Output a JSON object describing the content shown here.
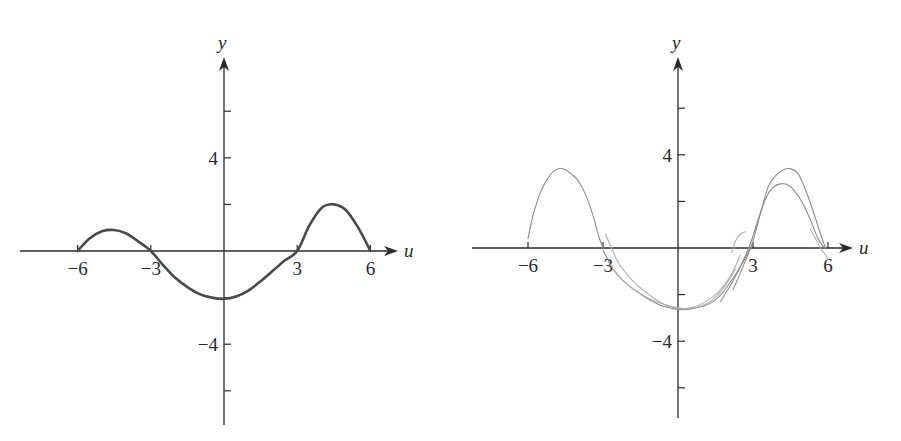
{
  "chart_data": [
    {
      "type": "line",
      "title": "",
      "xlabel": "u",
      "ylabel": "y",
      "xlim": [
        -8.5,
        7.5
      ],
      "ylim": [
        -7.5,
        8
      ],
      "x_ticks": [
        -6,
        -3,
        3,
        6
      ],
      "x_tick_labels": [
        "−6",
        "−3",
        "3",
        "6"
      ],
      "y_ticks": [
        -6,
        -4,
        -2,
        2,
        4,
        6
      ],
      "y_tick_labels": {
        "4": "4",
        "-4": "−4"
      },
      "grid": false,
      "series": [
        {
          "name": "graph",
          "style": "main",
          "x": [
            -6,
            -5.5,
            -5,
            -4.5,
            -4,
            -3.5,
            -3,
            -2.5,
            -2,
            -1.5,
            -1,
            -0.5,
            0,
            0.5,
            1,
            1.5,
            2,
            2.5,
            3,
            3.5,
            4,
            4.5,
            5,
            5.5,
            6
          ],
          "y": [
            0,
            0.55,
            0.85,
            0.9,
            0.75,
            0.4,
            0,
            -0.6,
            -1.15,
            -1.55,
            -1.85,
            -2.0,
            -2.05,
            -1.95,
            -1.7,
            -1.3,
            -0.85,
            -0.4,
            0,
            1.1,
            1.85,
            2.0,
            1.75,
            1.0,
            0
          ]
        }
      ]
    },
    {
      "type": "line",
      "title": "",
      "xlabel": "u",
      "ylabel": "y",
      "xlim": [
        -8.5,
        7.5
      ],
      "ylim": [
        -7.5,
        8
      ],
      "x_ticks": [
        -6,
        -3,
        3,
        6
      ],
      "x_tick_labels": [
        "−6",
        "−3",
        "3",
        "6"
      ],
      "y_ticks": [
        -6,
        -4,
        -2,
        2,
        4,
        6
      ],
      "y_tick_labels": {
        "4": "4",
        "-4": "−4"
      },
      "grid": false,
      "series": [
        {
          "name": "sketch-left-hump",
          "style": "sketch",
          "x": [
            -6,
            -5.8,
            -5.5,
            -5.2,
            -4.9,
            -4.6,
            -4.3,
            -4.0,
            -3.7,
            -3.4,
            -3.2,
            -3.0
          ],
          "y": [
            0.4,
            1.4,
            2.4,
            3.0,
            3.35,
            3.4,
            3.2,
            2.9,
            2.3,
            1.4,
            0.6,
            0
          ]
        },
        {
          "name": "sketch-middle-1",
          "style": "sketch",
          "x": [
            -3,
            -2.6,
            -2.2,
            -1.8,
            -1.4,
            -1.0,
            -0.6,
            -0.2,
            0.2,
            0.6,
            1.0,
            1.4,
            1.8,
            2.2,
            2.6,
            2.9
          ],
          "y": [
            -0.1,
            -0.9,
            -1.4,
            -1.75,
            -2.05,
            -2.3,
            -2.5,
            -2.6,
            -2.65,
            -2.6,
            -2.5,
            -2.3,
            -1.9,
            -1.3,
            -0.6,
            0
          ]
        },
        {
          "name": "sketch-middle-2",
          "style": "sketch-light",
          "x": [
            -2.9,
            -2.4,
            -1.9,
            -1.4,
            -0.9,
            -0.4,
            0.1,
            0.6,
            1.1,
            1.6,
            2.1,
            2.5
          ],
          "y": [
            0.6,
            -0.6,
            -1.3,
            -1.8,
            -2.2,
            -2.5,
            -2.6,
            -2.55,
            -2.3,
            -1.9,
            -1.2,
            -0.3
          ]
        },
        {
          "name": "sketch-middle-3",
          "style": "sketch-light",
          "x": [
            -2.6,
            -2.1,
            -1.6,
            -1.1,
            -0.6,
            -0.1,
            0.4,
            0.9,
            1.4,
            1.9,
            2.3
          ],
          "y": [
            -0.9,
            -1.5,
            -1.9,
            -2.2,
            -2.4,
            -2.55,
            -2.6,
            -2.5,
            -2.2,
            -1.6,
            -0.9
          ]
        },
        {
          "name": "sketch-right-hump-1",
          "style": "sketch",
          "x": [
            2.2,
            2.6,
            3.0,
            3.3,
            3.6,
            3.9,
            4.2,
            4.5,
            4.8,
            5.1,
            5.4,
            5.7,
            5.9
          ],
          "y": [
            -1.8,
            -0.8,
            0.3,
            1.5,
            2.6,
            3.1,
            3.35,
            3.4,
            3.2,
            2.5,
            1.6,
            0.6,
            0
          ]
        },
        {
          "name": "sketch-right-hump-2",
          "style": "sketch",
          "x": [
            1.7,
            2.1,
            2.5,
            2.9,
            3.2,
            3.5,
            3.8,
            4.1,
            4.4,
            4.7,
            5.0,
            5.3,
            5.6,
            5.85
          ],
          "y": [
            -2.3,
            -1.6,
            -0.8,
            0.2,
            1.2,
            2.1,
            2.6,
            2.75,
            2.7,
            2.4,
            1.9,
            1.2,
            0.4,
            0
          ]
        },
        {
          "name": "sketch-stroke-a",
          "style": "sketch-light",
          "x": [
            2.15,
            2.3,
            2.5,
            2.7
          ],
          "y": [
            -0.2,
            0.3,
            0.6,
            0.7
          ]
        },
        {
          "name": "sketch-stroke-b",
          "style": "sketch-light",
          "x": [
            5.3,
            5.5,
            5.7,
            5.9,
            6.0
          ],
          "y": [
            0.8,
            0.4,
            0.0,
            -0.3,
            -0.5
          ]
        }
      ]
    }
  ]
}
